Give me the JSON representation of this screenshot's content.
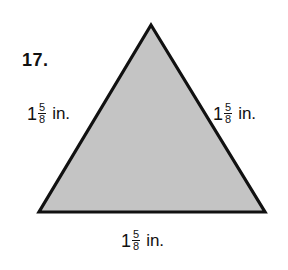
{
  "problem": {
    "number": "17."
  },
  "figure": {
    "shape": "equilateral-triangle",
    "fill_color": "#c4c4c4",
    "stroke_color": "#111111",
    "vertices": {
      "apex": [
        151,
        25
      ],
      "bottom_left": [
        39,
        212
      ],
      "bottom_right": [
        265,
        212
      ]
    }
  },
  "labels": {
    "left_side": {
      "whole": "1",
      "numerator": "5",
      "denominator": "8",
      "unit": "in."
    },
    "right_side": {
      "whole": "1",
      "numerator": "5",
      "denominator": "8",
      "unit": "in."
    },
    "bottom_side": {
      "whole": "1",
      "numerator": "5",
      "denominator": "8",
      "unit": "in."
    }
  }
}
